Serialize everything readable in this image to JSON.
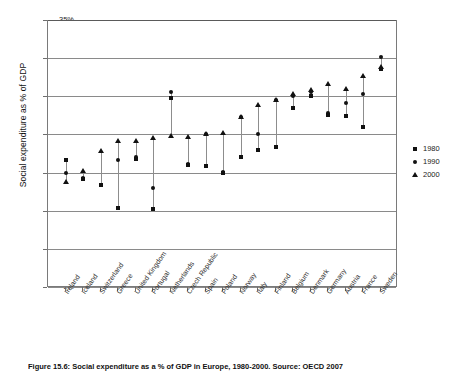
{
  "figure": {
    "caption": "Figure 15.6: Social expenditure as a % of GDP in Europe, 1980-2000. Source: OECD 2007"
  },
  "legend": {
    "position": "right",
    "items": [
      {
        "label": "1980",
        "marker": "square-marker-icon"
      },
      {
        "label": "1990",
        "marker": "circle-marker-icon"
      },
      {
        "label": "2000",
        "marker": "triangle-marker-icon"
      }
    ]
  },
  "chart_data": {
    "type": "scatter",
    "title": "",
    "xlabel": "",
    "ylabel": "Social expenditure as % of GDP",
    "ylim": [
      0,
      35
    ],
    "ytick_labels": [
      "0%",
      "5%",
      "10%",
      "15%",
      "20%",
      "25%",
      "30%",
      "35%"
    ],
    "ytick_values": [
      0,
      5,
      10,
      15,
      20,
      25,
      30,
      35
    ],
    "grid": true,
    "categories": [
      "Ireland",
      "Iceland",
      "Switzerland",
      "Greece",
      "United Kingdom",
      "Portugal",
      "Netherlands",
      "Czech Republic",
      "Spain",
      "Poland",
      "Norway",
      "Italy",
      "Finland",
      "Belgium",
      "Denmark",
      "Germany",
      "Austria",
      "France",
      "Sweden"
    ],
    "series": [
      {
        "name": "1980",
        "marker": "square",
        "values": [
          16.7,
          14.1,
          13.4,
          10.3,
          16.8,
          10.2,
          24.8,
          16.0,
          15.8,
          15.0,
          17.0,
          18.0,
          18.4,
          23.5,
          25.0,
          22.5,
          22.4,
          21.0,
          28.6
        ]
      },
      {
        "name": "1990",
        "marker": "circle",
        "values": [
          15.0,
          14.3,
          13.4,
          16.6,
          17.0,
          13.0,
          25.5,
          16.1,
          20.1,
          15.1,
          22.3,
          20.0,
          24.5,
          25.1,
          25.5,
          22.8,
          24.1,
          25.3,
          30.2
        ]
      },
      {
        "name": "2000",
        "marker": "triangle",
        "values": [
          13.8,
          15.2,
          17.8,
          19.2,
          19.1,
          19.5,
          19.8,
          19.7,
          20.0,
          20.2,
          22.3,
          23.8,
          24.5,
          25.3,
          25.8,
          26.6,
          26.0,
          27.6,
          28.8
        ]
      }
    ]
  }
}
